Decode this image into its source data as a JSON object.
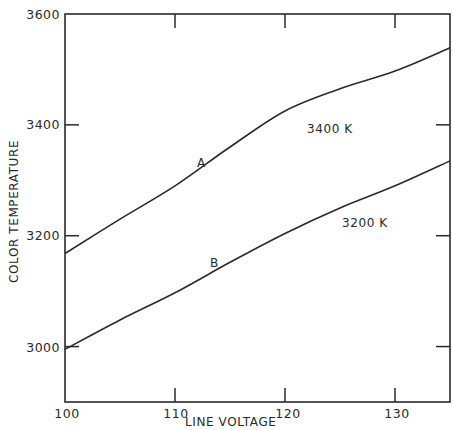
{
  "chart_data": {
    "type": "line",
    "title": "",
    "xlabel": "LINE VOLTAGE",
    "ylabel": "COLOR TEMPERATURE",
    "xlim": [
      100,
      135
    ],
    "ylim": [
      2900,
      3600
    ],
    "x_ticks": [
      "100",
      "110",
      "120",
      "130"
    ],
    "y_ticks": [
      "3000",
      "3200",
      "3400",
      "3600"
    ],
    "grid": false,
    "x": [
      100,
      105,
      110,
      115,
      120,
      125,
      130,
      135
    ],
    "series": [
      {
        "name": "A",
        "annotation": "3400 K",
        "values": [
          3168,
          3230,
          3290,
          3360,
          3425,
          3465,
          3497,
          3539
        ]
      },
      {
        "name": "B",
        "annotation": "3200 K",
        "values": [
          2995,
          3048,
          3097,
          3152,
          3204,
          3250,
          3290,
          3335
        ]
      }
    ]
  }
}
